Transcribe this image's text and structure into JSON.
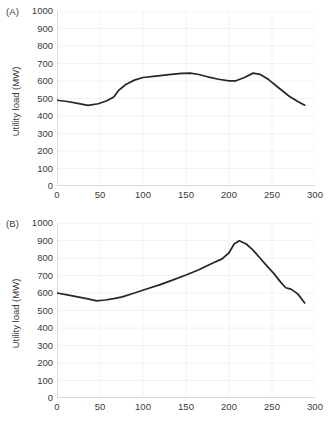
{
  "figure": {
    "background": "#ffffff",
    "line_color": "#262626",
    "grid_color": "#f2f2f2",
    "axis_color": "#d9d9d9",
    "text_color": "#3a3a3a"
  },
  "panels": [
    {
      "label": "(A)",
      "ylabel": "Utility load (MW)"
    },
    {
      "label": "(B)",
      "ylabel": "Utility load (MW)"
    }
  ],
  "ticks": {
    "y": [
      "1000",
      "900",
      "800",
      "700",
      "600",
      "500",
      "400",
      "300",
      "200",
      "100",
      "0"
    ],
    "x": [
      "0",
      "50",
      "100",
      "150",
      "200",
      "250",
      "300"
    ]
  },
  "chart_data": [
    {
      "type": "line",
      "panel": "(A)",
      "title": "",
      "xlabel": "",
      "ylabel": "Utility load (MW)",
      "xlim": [
        0,
        300
      ],
      "ylim": [
        0,
        1000
      ],
      "xticks": [
        0,
        50,
        100,
        150,
        200,
        250,
        300
      ],
      "yticks": [
        0,
        100,
        200,
        300,
        400,
        500,
        600,
        700,
        800,
        900,
        1000
      ],
      "grid": true,
      "legend": "none",
      "series": [
        {
          "name": "Utility load (A)",
          "color": "#262626",
          "x": [
            0,
            12,
            24,
            36,
            48,
            58,
            66,
            72,
            80,
            90,
            100,
            115,
            130,
            145,
            155,
            165,
            175,
            188,
            200,
            208,
            218,
            228,
            236,
            246,
            258,
            270,
            280,
            288
          ],
          "y": [
            490,
            483,
            472,
            461,
            470,
            487,
            508,
            548,
            580,
            605,
            620,
            628,
            636,
            644,
            645,
            637,
            624,
            610,
            601,
            601,
            620,
            645,
            638,
            608,
            560,
            513,
            483,
            462
          ]
        }
      ]
    },
    {
      "type": "line",
      "panel": "(B)",
      "title": "",
      "xlabel": "",
      "ylabel": "Utility load (MW)",
      "xlim": [
        0,
        300
      ],
      "ylim": [
        0,
        1000
      ],
      "xticks": [
        0,
        50,
        100,
        150,
        200,
        250,
        300
      ],
      "yticks": [
        0,
        100,
        200,
        300,
        400,
        500,
        600,
        700,
        800,
        900,
        1000
      ],
      "grid": true,
      "legend": "none",
      "series": [
        {
          "name": "Utility load (B)",
          "color": "#262626",
          "x": [
            0,
            12,
            24,
            36,
            46,
            56,
            66,
            76,
            90,
            105,
            120,
            135,
            150,
            165,
            180,
            192,
            200,
            206,
            212,
            220,
            228,
            236,
            244,
            252,
            260,
            266,
            272,
            280,
            288
          ],
          "y": [
            600,
            589,
            578,
            566,
            555,
            560,
            568,
            578,
            600,
            624,
            648,
            675,
            703,
            733,
            768,
            795,
            830,
            880,
            898,
            880,
            845,
            800,
            755,
            712,
            662,
            630,
            622,
            595,
            543
          ]
        }
      ]
    }
  ]
}
